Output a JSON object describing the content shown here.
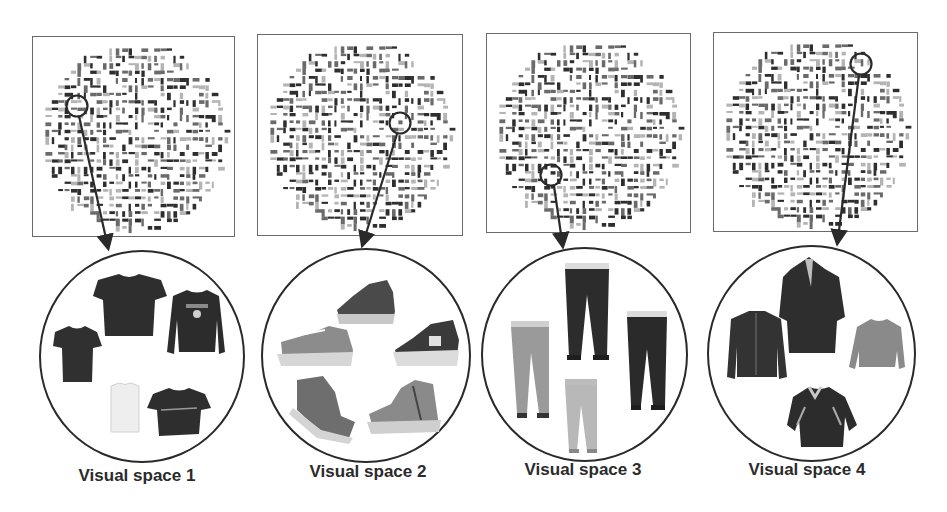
{
  "figure": {
    "panels": [
      {
        "label": "Visual space 1",
        "category": "t-shirts / tops",
        "item_icons": [
          "tshirt-icon",
          "tshirt-icon",
          "sweatshirt-icon",
          "tshirt-white-icon",
          "tshirt-icon"
        ]
      },
      {
        "label": "Visual space 2",
        "category": "sneakers",
        "item_icons": [
          "sneaker-icon",
          "sneaker-icon",
          "sneaker-icon",
          "sneaker-icon",
          "sneaker-icon"
        ]
      },
      {
        "label": "Visual space 3",
        "category": "trousers",
        "item_icons": [
          "pants-icon",
          "pants-icon",
          "pants-icon",
          "pants-icon"
        ]
      },
      {
        "label": "Visual space 4",
        "category": "jackets",
        "item_icons": [
          "jacket-icon",
          "jacket-icon",
          "jacket-icon",
          "jacket-icon"
        ]
      }
    ],
    "colors": {
      "line": "#2a2a2a",
      "box_border": "#6a6a6a",
      "dark_item": "#2e2e2e",
      "mid_item": "#7a7a7a",
      "light_item": "#c8c8c8"
    }
  }
}
